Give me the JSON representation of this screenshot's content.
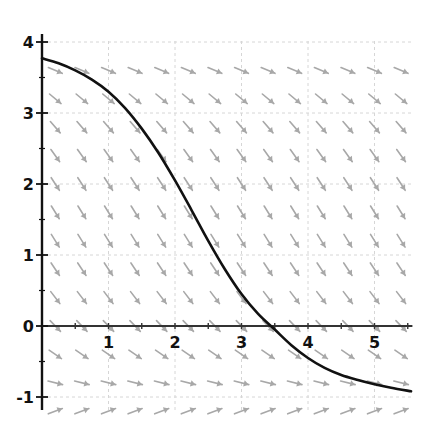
{
  "chart_data": {
    "type": "line",
    "title": "",
    "subtitle": "Slope field (direction field) with solution curve",
    "xlabel": "",
    "ylabel": "",
    "xlim": [
      0,
      5.57
    ],
    "ylim": [
      -1.2,
      4.1
    ],
    "grid": true,
    "legend": null,
    "x_ticks": [
      1,
      2,
      3,
      4,
      5
    ],
    "x_tick_labels": [
      "1",
      "2",
      "3",
      "4",
      "5"
    ],
    "y_ticks": [
      -1,
      0,
      1,
      2,
      3,
      4
    ],
    "y_tick_labels": [
      "-1",
      "0",
      "1",
      "2",
      "3",
      "4"
    ],
    "series": [
      {
        "name": "solution curve",
        "color": "#111111",
        "x": [
          0,
          0.25,
          0.5,
          0.75,
          1.0,
          1.25,
          1.5,
          1.75,
          2.0,
          2.25,
          2.5,
          2.75,
          3.0,
          3.25,
          3.5,
          3.75,
          4.0,
          4.25,
          4.5,
          4.75,
          5.0,
          5.25,
          5.55
        ],
        "y": [
          3.77,
          3.7,
          3.6,
          3.47,
          3.3,
          3.07,
          2.78,
          2.44,
          2.05,
          1.63,
          1.2,
          0.8,
          0.45,
          0.17,
          -0.05,
          -0.27,
          -0.45,
          -0.59,
          -0.69,
          -0.76,
          -0.82,
          -0.87,
          -0.92
        ]
      }
    ],
    "slope_field": {
      "color": "#a8a8a8",
      "x_samples": [
        0.2,
        0.6,
        1.0,
        1.4,
        1.8,
        2.2,
        2.6,
        3.0,
        3.4,
        3.8,
        4.2,
        4.6,
        5.0,
        5.4
      ],
      "y_samples": [
        3.6,
        3.2,
        2.8,
        2.4,
        2.0,
        1.6,
        1.2,
        0.8,
        0.4,
        0.0,
        -0.4,
        -0.8,
        -1.2
      ],
      "note": "autonomous equation; slopes depend on y only, negative above y=-1, positive below y=-1"
    }
  }
}
